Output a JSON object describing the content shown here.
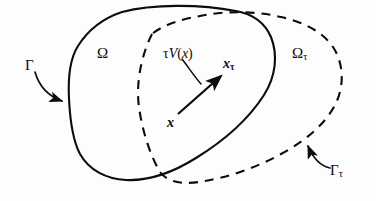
{
  "figure": {
    "type": "math-diagram",
    "background_color": "#fdfdfd",
    "ink_color": "#0c0c0c",
    "width": 376,
    "height": 201
  },
  "labels": {
    "omega": "Ω",
    "gamma": "Γ",
    "omega_tau_base": "Ω",
    "omega_tau_sub": "τ",
    "gamma_tau_base": "Γ",
    "gamma_tau_sub": "τ",
    "tau_v_of_x_tau": "τ",
    "tau_v_of_x_v": "V",
    "tau_v_of_x_open": "(",
    "tau_v_of_x_arg": "x",
    "tau_v_of_x_close": ")",
    "x_tau_base": "x",
    "x_tau_sub": "τ",
    "x": "x"
  },
  "curves": {
    "solid_boundary_name": "Γ",
    "solid_boundary_style": "solid",
    "dashed_boundary_name": "Γτ",
    "dashed_boundary_style": "dashed",
    "dash_pattern": "9 7",
    "stroke_width": 2.1
  },
  "annotations": {
    "gamma_leader": "curved arrow from Γ label to solid boundary",
    "gamma_tau_leader": "curved arrow from Γτ label to dashed boundary",
    "tv_leader": "curved leader from τV(x) label to displacement vector",
    "displacement_vector": "arrow from x to x_τ"
  }
}
